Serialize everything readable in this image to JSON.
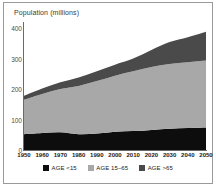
{
  "chart_data": {
    "type": "area",
    "stacked": true,
    "title": "Population (millions)",
    "xlabel": "",
    "ylabel": "Population (millions)",
    "x": [
      1950,
      1960,
      1970,
      1980,
      1990,
      2000,
      2010,
      2020,
      2030,
      2040,
      2050
    ],
    "categories": [
      "1950",
      "1960",
      "1970",
      "1980",
      "1990",
      "2000",
      "2010",
      "2020",
      "2030",
      "2040",
      "2050"
    ],
    "xlim": [
      1950,
      2050
    ],
    "ylim": [
      0,
      420
    ],
    "yticks": [
      0,
      100,
      200,
      300,
      400
    ],
    "ytick_labels": [
      "0",
      "100",
      "200",
      "300",
      "400"
    ],
    "grid": false,
    "legend_position": "bottom",
    "series": [
      {
        "name": "AGE <15",
        "color": "#0d0d0d",
        "values": [
          52,
          56,
          58,
          52,
          54,
          60,
          62,
          66,
          70,
          72,
          74
        ]
      },
      {
        "name": "AGE 15-65",
        "color": "#a8a8a8",
        "values": [
          113,
          128,
          142,
          158,
          172,
          184,
          196,
          206,
          212,
          216,
          220
        ]
      },
      {
        "name": "AGE >65",
        "color": "#4a4a4a",
        "values": [
          13,
          18,
          22,
          28,
          32,
          36,
          42,
          56,
          72,
          82,
          94
        ]
      }
    ],
    "cumulative_totals": [
      178,
      202,
      222,
      238,
      258,
      280,
      300,
      328,
      354,
      370,
      388
    ]
  },
  "legend": {
    "items": [
      {
        "label": "AGE <15",
        "color": "#0d0d0d"
      },
      {
        "label": "AGE 15–65",
        "color": "#a8a8a8"
      },
      {
        "label": "AGE >65",
        "color": "#4a4a4a"
      }
    ]
  },
  "colors": {
    "frame": "#9a9a9a",
    "axis": "#6a6a6a",
    "background": "#ffffff",
    "tick_text": "#1a1a1a"
  }
}
